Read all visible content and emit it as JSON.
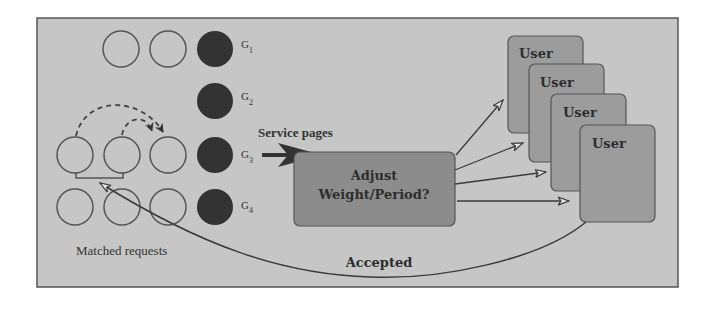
{
  "diagram": {
    "colors": {
      "page_bg": "#ffffff",
      "panel_fill": "#c6c6c6",
      "panel_border": "#555555",
      "adjust_fill": "#8c8c8c",
      "user_fill": "#9c9c9c",
      "dark_circle": "#333333",
      "stroke": "#3a3a3a"
    },
    "groups": [
      {
        "label": "G",
        "subscript": "1",
        "empty_slots": 2
      },
      {
        "label": "G",
        "subscript": "2",
        "empty_slots": 0
      },
      {
        "label": "G",
        "subscript": "3",
        "empty_slots": 3
      },
      {
        "label": "G",
        "subscript": "4",
        "empty_slots": 3
      }
    ],
    "labels": {
      "service_pages": "Service pages",
      "adjust_line1": "Adjust",
      "adjust_line2": "Weight/Period?",
      "matched_requests": "Matched requests",
      "accepted": "Accepted"
    },
    "users": [
      {
        "label": "User"
      },
      {
        "label": "User"
      },
      {
        "label": "User"
      },
      {
        "label": "User"
      }
    ]
  }
}
